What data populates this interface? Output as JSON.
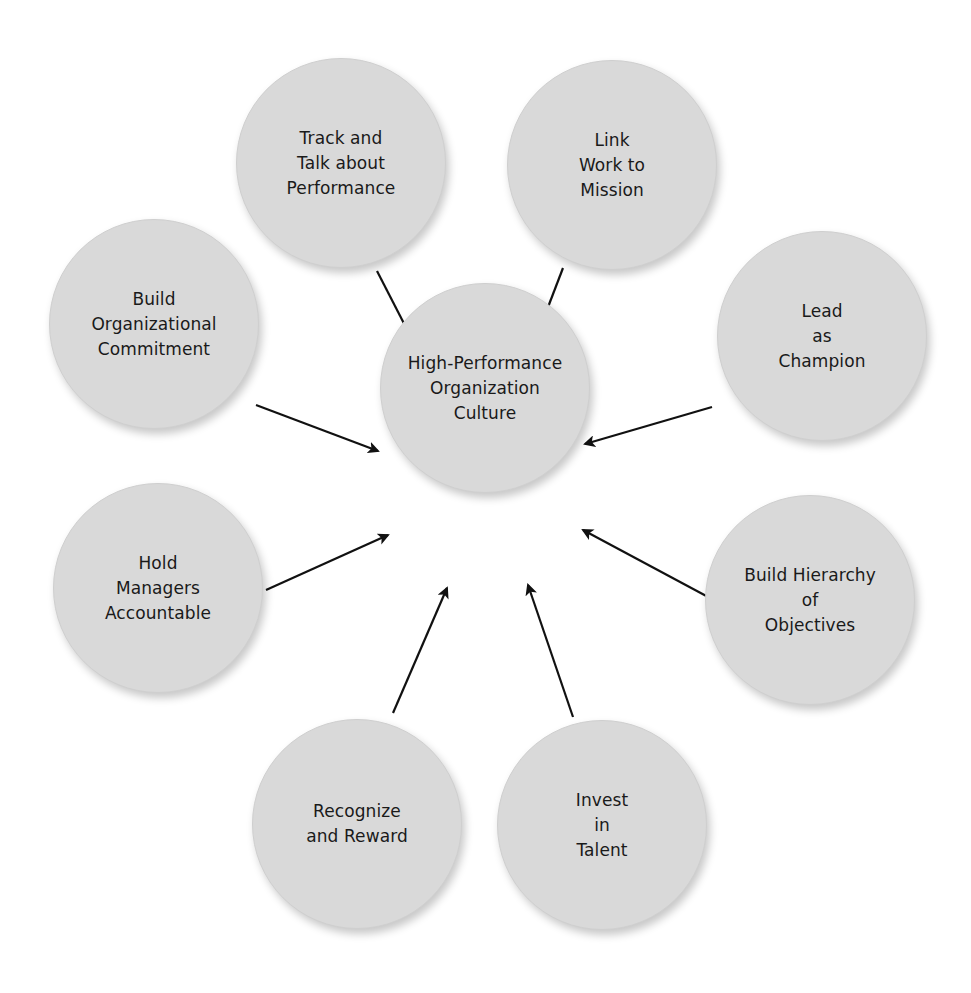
{
  "diagram": {
    "center": {
      "label": "High-Performance\nOrganization\nCulture"
    },
    "nodes": [
      {
        "label": "Track and\nTalk about\nPerformance"
      },
      {
        "label": "Link\nWork to\nMission"
      },
      {
        "label": "Lead\nas\nChampion"
      },
      {
        "label": "Build Hierarchy\nof\nObjectives"
      },
      {
        "label": "Invest\nin\nTalent"
      },
      {
        "label": "Recognize\nand Reward"
      },
      {
        "label": "Hold\nManagers\nAccountable"
      },
      {
        "label": "Build\nOrganizational\nCommitment"
      }
    ],
    "colors": {
      "circle_fill": "#d9d9d9",
      "arrow": "#111111",
      "text": "#1a1a1a",
      "background": "#ffffff"
    }
  }
}
